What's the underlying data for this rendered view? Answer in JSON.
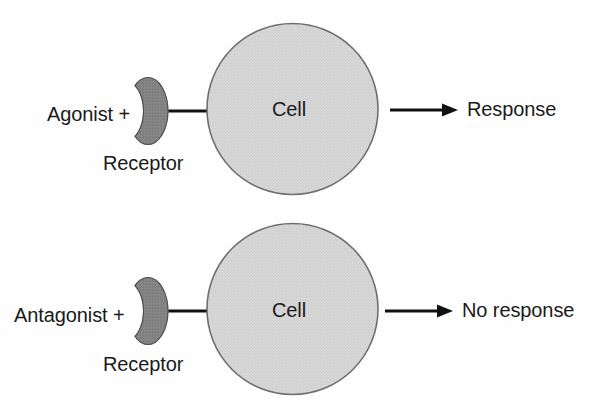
{
  "figure": {
    "type": "diagram",
    "background_color": "#fefefe",
    "width": 594,
    "height": 414,
    "colors": {
      "cell_fill": "#d4d4d4",
      "cell_stroke": "#6b6b6b",
      "receptor_fill": "#808080",
      "receptor_stroke": "#4d4d4d",
      "line": "#111111",
      "text": "#1a1a1a"
    }
  },
  "rows": [
    {
      "id": "agonist-row",
      "ligand_label": "Agonist +",
      "receptor_label": "Receptor",
      "cell_label": "Cell",
      "outcome_label": "Response"
    },
    {
      "id": "antagonist-row",
      "ligand_label": "Antagonist +",
      "receptor_label": "Receptor",
      "cell_label": "Cell",
      "outcome_label": "No response"
    }
  ],
  "icons": {
    "receptor": "crescent-receptor-icon",
    "cell": "cell-circle-icon",
    "arrow": "arrow-right-icon",
    "connector": "connector-line-icon"
  }
}
